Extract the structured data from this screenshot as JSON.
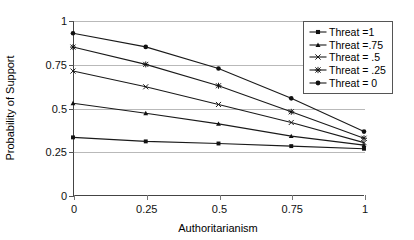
{
  "chart_data": {
    "type": "line",
    "title": "",
    "xlabel": "Authoritarianism",
    "ylabel": "Probability of Support",
    "x": [
      0,
      0.25,
      0.5,
      0.75,
      1
    ],
    "xtick_labels": [
      "0",
      "0.25",
      "0.5",
      "0.75",
      "1"
    ],
    "ytick_labels": [
      "0",
      "0.25",
      "0.5",
      "0.75",
      "1"
    ],
    "xlim": [
      0,
      1
    ],
    "ylim": [
      0,
      1
    ],
    "grid": "horizontal",
    "legend_position": "top-right",
    "series": [
      {
        "name": "Threat =1",
        "marker": "square",
        "values": [
          0.335,
          0.312,
          0.3,
          0.285,
          0.27
        ]
      },
      {
        "name": "Threat =.75",
        "marker": "triangle",
        "values": [
          0.53,
          0.473,
          0.412,
          0.342,
          0.291
        ]
      },
      {
        "name": "Threat = .5",
        "marker": "x",
        "values": [
          0.714,
          0.624,
          0.523,
          0.42,
          0.305
        ]
      },
      {
        "name": "Threat = .25",
        "marker": "star",
        "values": [
          0.851,
          0.752,
          0.63,
          0.481,
          0.33
        ]
      },
      {
        "name": "Threat = 0",
        "marker": "circle",
        "values": [
          0.93,
          0.852,
          0.729,
          0.558,
          0.368
        ]
      }
    ]
  },
  "legend": {
    "items": [
      {
        "label": "Threat =1"
      },
      {
        "label": "Threat =.75"
      },
      {
        "label": "Threat = .5"
      },
      {
        "label": "Threat = .25"
      },
      {
        "label": "Threat = 0"
      }
    ]
  },
  "axes": {
    "x_title": "Authoritarianism",
    "y_title": "Probability of Support",
    "x_ticks": [
      "0",
      "0.25",
      "0.5",
      "0.75",
      "1"
    ],
    "y_ticks": [
      "0",
      "0.25",
      "0.5",
      "0.75",
      "1"
    ]
  },
  "colors": {
    "line": "#1a1a1a",
    "grid": "#b9b9b9",
    "axis": "#444444",
    "background": "#ffffff"
  }
}
